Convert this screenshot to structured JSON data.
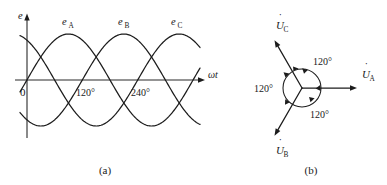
{
  "figure": {
    "title_alt": "Three-phase EMF waveforms and phasor diagram",
    "captions": {
      "left": "(a)",
      "right": "(b)"
    }
  },
  "waveform_panel": {
    "y_axis_label": "e",
    "x_axis_label": "ωt",
    "origin_label": "0",
    "curve_labels": [
      {
        "base": "e",
        "sub": "A"
      },
      {
        "base": "e",
        "sub": "B"
      },
      {
        "base": "e",
        "sub": "C"
      }
    ],
    "x_ticks": [
      "120°",
      "240°"
    ],
    "line_color": "#1c1c1c",
    "axis_color": "#2a2a2a"
  },
  "phasor_panel": {
    "phasor_labels": [
      {
        "base": "U",
        "sub": "A",
        "dot": "˙"
      },
      {
        "base": "U",
        "sub": "B",
        "dot": "˙"
      },
      {
        "base": "U",
        "sub": "C",
        "dot": "˙"
      }
    ],
    "angle_labels": [
      "120°",
      "120°",
      "120°"
    ],
    "line_color": "#1c1c1c"
  },
  "chart_data": {
    "type": "line",
    "xlabel": "ωt",
    "ylabel": "e",
    "xlim": [
      -20,
      410
    ],
    "ylim": [
      -1.15,
      1.15
    ],
    "grid": false,
    "legend": "inline-curve-labels",
    "x_tick_values": [
      0,
      120,
      240
    ],
    "x_tick_labels": [
      "0",
      "120°",
      "240°"
    ],
    "series": [
      {
        "name": "eA",
        "phase_deg": 0,
        "amplitude": 1,
        "label_at_deg": 90
      },
      {
        "name": "eB",
        "phase_deg": -120,
        "amplitude": 1,
        "label_at_deg": 210
      },
      {
        "name": "eC",
        "phase_deg": -240,
        "amplitude": 1,
        "label_at_deg": 330
      }
    ],
    "phasors": [
      {
        "name": "UA",
        "angle_deg": 0,
        "magnitude": 1
      },
      {
        "name": "UB",
        "angle_deg": -120,
        "magnitude": 1
      },
      {
        "name": "UC",
        "angle_deg": 120,
        "magnitude": 1
      }
    ],
    "phasor_separation_deg": 120
  }
}
